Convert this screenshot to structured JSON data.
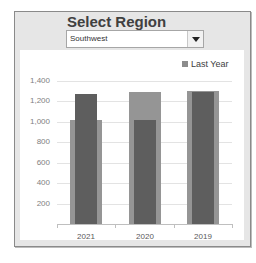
{
  "header": {
    "title": "Select Region",
    "dropdown": {
      "selected": "Southwest"
    }
  },
  "chart_data": {
    "type": "bar",
    "title": "",
    "xlabel": "",
    "ylabel": "",
    "categories": [
      "2021",
      "2020",
      "2019"
    ],
    "series": [
      {
        "name": "This Year",
        "style": "wide light bar",
        "color": "#959595",
        "values": [
          1020,
          1290,
          1305
        ]
      },
      {
        "name": "Last Year",
        "style": "narrow dark bar",
        "color": "#5e5e5e",
        "values": [
          1270,
          1020,
          1295
        ]
      }
    ],
    "legend": {
      "entries": [
        "Last Year"
      ],
      "position": "top-right"
    },
    "yticks": [
      "200",
      "400",
      "600",
      "800",
      "1,000",
      "1,200",
      "1,400"
    ],
    "ylim": [
      0,
      1400
    ],
    "grid": true
  },
  "colors": {
    "panel_bg": "#e6e6e6",
    "bar_wide": "#959595",
    "bar_narrow": "#5e5e5e"
  }
}
